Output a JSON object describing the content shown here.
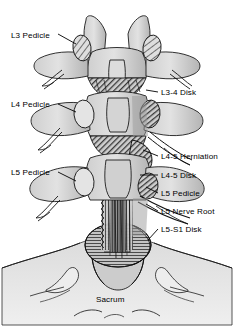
{
  "figure": {
    "kind": "medical-illustration",
    "view": "posterior coronal view of lumbar spine and sacrum",
    "background_color": "#ffffff",
    "palette": {
      "bone_light": "#d9d9d9",
      "bone_mid": "#bfbfbf",
      "bone_shadow": "#9a9a9a",
      "dark_fill": "#3d3d3d",
      "outline": "#1a1a1a",
      "label_text": "#000000",
      "leader_line": "#000000"
    }
  },
  "labels": {
    "left": [
      {
        "name": "l3-pedicle",
        "text": "L3 Pedicle",
        "x": 11,
        "y": 32
      },
      {
        "name": "l4-pedicle",
        "text": "L4 Pedicle",
        "x": 11,
        "y": 101
      },
      {
        "name": "l5-pedicle",
        "text": "L5 Pedicle",
        "x": 11,
        "y": 169
      }
    ],
    "right": [
      {
        "name": "l3-4-disk",
        "text": "L3-4 Disk",
        "x": 161,
        "y": 89
      },
      {
        "name": "l4-5-herniation",
        "text": "L4-5 Herniation",
        "x": 161,
        "y": 153
      },
      {
        "name": "l4-5-disk",
        "text": "L4-5 Disk",
        "x": 161,
        "y": 172
      },
      {
        "name": "l5-pedicle-right",
        "text": "L5 Pedicle",
        "x": 161,
        "y": 190
      },
      {
        "name": "l5-nerve-root",
        "text": "L5 Nerve Root",
        "x": 161,
        "y": 208
      },
      {
        "name": "l5-s1-disk",
        "text": "L5-S1 Disk",
        "x": 161,
        "y": 226
      }
    ],
    "center": [
      {
        "name": "sacrum",
        "text": "Sacrum",
        "x": 96,
        "y": 296
      }
    ]
  }
}
